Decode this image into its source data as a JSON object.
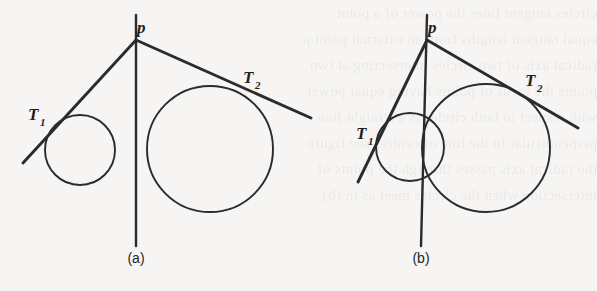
{
  "figure": {
    "background_color": "#f6f5f3",
    "ink_color": "#2b2b2b",
    "panels": [
      {
        "id": "a",
        "caption": "(a)",
        "apex_label": "p",
        "tangent_point_labels": {
          "first": "T",
          "first_sub": "1",
          "second": "T",
          "second_sub": "2"
        },
        "circles": [
          {
            "name": "small-circle",
            "cx": 80,
            "cy": 150,
            "r": 35
          },
          {
            "name": "large-circle",
            "cx": 210,
            "cy": 149,
            "r": 63
          }
        ],
        "apex": {
          "x": 136,
          "y": 40
        },
        "lines": [
          {
            "name": "left-tangent",
            "x1": 136,
            "y1": 40,
            "x2": 23,
            "y2": 163
          },
          {
            "name": "right-tangent",
            "x1": 136,
            "y1": 40,
            "x2": 311,
            "y2": 118
          },
          {
            "name": "vertical-axis",
            "x1": 136,
            "y1": 15,
            "x2": 136,
            "y2": 246
          }
        ]
      },
      {
        "id": "b",
        "caption": "(b)",
        "apex_label": "p",
        "tangent_point_labels": {
          "first": "T",
          "first_sub": "1",
          "second": "T",
          "second_sub": "2"
        },
        "circles": [
          {
            "name": "small-circle",
            "cx": 410,
            "cy": 147,
            "r": 34
          },
          {
            "name": "large-circle",
            "cx": 486,
            "cy": 148,
            "r": 64
          }
        ],
        "apex": {
          "x": 427,
          "y": 40
        },
        "lines": [
          {
            "name": "left-tangent",
            "x1": 427,
            "y1": 40,
            "x2": 358,
            "y2": 182
          },
          {
            "name": "right-tangent",
            "x1": 427,
            "y1": 40,
            "x2": 578,
            "y2": 128
          },
          {
            "name": "vertical-axis",
            "x1": 427,
            "y1": 15,
            "x2": 421,
            "y2": 246
          }
        ]
      }
    ]
  },
  "labels": {
    "panel_a": {
      "apex": "p",
      "t1_base": "T",
      "t1_sub": "1",
      "t2_base": "T",
      "t2_sub": "2",
      "caption": "(a)"
    },
    "panel_b": {
      "apex": "p",
      "t1_base": "T",
      "t1_sub": "1",
      "t2_base": "T",
      "t2_sub": "2",
      "caption": "(b)"
    }
  },
  "bleed_text": "circles tangent lines the power of a point\nequal tangent lengths from an external point p\nradical axis of two circles intersecting at two\npoints the locus of points having equal power\nwith respect to both circles is a straight line\nperpendicular to the line of centres see figure\nthe radical axis passes through the points of\nintersection when the circles meet as in (b)"
}
